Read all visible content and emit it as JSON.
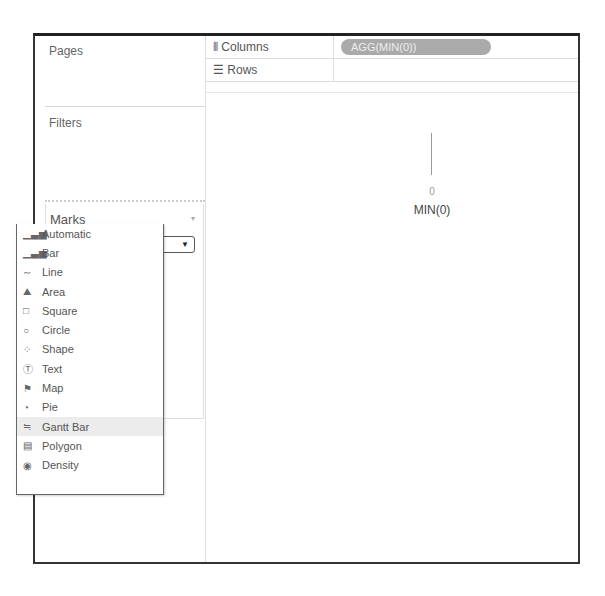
{
  "cards": {
    "pages": "Pages",
    "filters": "Filters",
    "marks": {
      "title": "Marks",
      "selected": {
        "icon": "bar-chart-icon",
        "glyph": "▁▃▅",
        "label": "Automatic"
      }
    }
  },
  "dropdown": {
    "items": [
      {
        "label": "Automatic",
        "icon": "bar-chart-icon",
        "glyph": "▁▃▅"
      },
      {
        "label": "Bar",
        "icon": "bar-chart-icon",
        "glyph": "▁▃▅"
      },
      {
        "label": "Line",
        "icon": "line-icon",
        "glyph": "∼"
      },
      {
        "label": "Area",
        "icon": "area-icon",
        "glyph": "⛰"
      },
      {
        "label": "Square",
        "icon": "square-icon",
        "glyph": "□"
      },
      {
        "label": "Circle",
        "icon": "circle-icon",
        "glyph": "○"
      },
      {
        "label": "Shape",
        "icon": "shape-icon",
        "glyph": "⁘"
      },
      {
        "label": "Text",
        "icon": "text-icon",
        "glyph": "Ⓣ"
      },
      {
        "label": "Map",
        "icon": "map-icon",
        "glyph": "⚑"
      },
      {
        "label": "Pie",
        "icon": "pie-icon",
        "glyph": "◔"
      },
      {
        "label": "Gantt Bar",
        "icon": "gantt-icon",
        "glyph": "≒",
        "hover": true
      },
      {
        "label": "Polygon",
        "icon": "polygon-icon",
        "glyph": "▤"
      },
      {
        "label": "Density",
        "icon": "density-icon",
        "glyph": "◉"
      }
    ]
  },
  "shelves": {
    "columns": {
      "icon": "columns-icon",
      "glyph": "⦀",
      "label": "Columns",
      "pill": "AGG(MIN(0))"
    },
    "rows": {
      "icon": "rows-icon",
      "glyph": "☰",
      "label": "Rows"
    }
  },
  "view": {
    "tick_value": "0",
    "axis_label": "MIN(0)"
  }
}
